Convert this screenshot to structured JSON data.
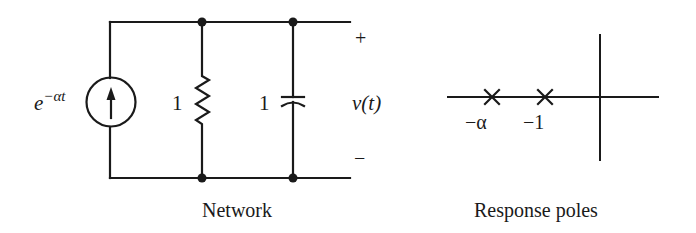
{
  "network": {
    "caption": "Network",
    "source": {
      "label_base": "e",
      "label_exp": "−αt",
      "type": "current-source",
      "direction": "up"
    },
    "resistor": {
      "label": "1"
    },
    "capacitor": {
      "label": "1"
    },
    "output": {
      "label": "v(t)",
      "plus": "+",
      "minus": "−"
    }
  },
  "poles": {
    "caption": "Response poles",
    "markers": [
      {
        "label": "−α"
      },
      {
        "label": "−1"
      }
    ]
  },
  "colors": {
    "ink": "#1a1a1a",
    "background": "#ffffff"
  }
}
